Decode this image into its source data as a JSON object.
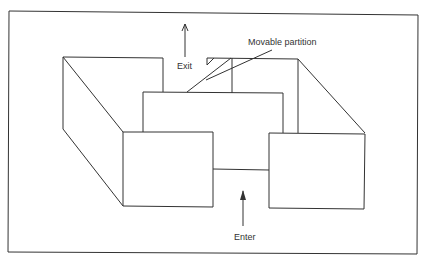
{
  "diagram": {
    "labels": {
      "exit": "Exit",
      "enter": "Enter",
      "movable_partition": "Movable partition"
    },
    "colors": {
      "line": "#333333",
      "background": "#ffffff"
    }
  }
}
